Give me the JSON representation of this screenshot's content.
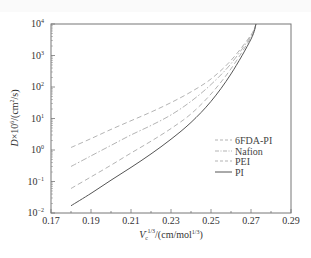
{
  "chart_data": {
    "type": "line",
    "title": "",
    "xlabel": "V_c^-1/3/(cm/mol^1/3)",
    "ylabel": "D×10^6/(cm^2/s)",
    "xlim": [
      0.17,
      0.29
    ],
    "ylim": [
      0.01,
      10000
    ],
    "yscale": "log",
    "grid": false,
    "legend_position": "center-right",
    "x_ticks": [
      "0.17",
      "0.19",
      "0.21",
      "0.23",
      "0.25",
      "0.27",
      "0.29"
    ],
    "y_ticks": [
      "10^-2",
      "10^-1",
      "10^0",
      "10^1",
      "10^2",
      "10^3",
      "10^4"
    ],
    "series": [
      {
        "name": "6FDA-PI",
        "style": "dashed",
        "color": "#aaaaaa",
        "x": [
          0.18,
          0.19,
          0.2,
          0.21,
          0.22,
          0.23,
          0.24,
          0.25,
          0.26,
          0.27,
          0.2725
        ],
        "y": [
          1.2,
          2.3,
          4.5,
          8.5,
          16,
          32,
          70,
          180,
          700,
          4500,
          10000
        ]
      },
      {
        "name": "Nafion",
        "style": "dashdot",
        "color": "#aaaaaa",
        "x": [
          0.18,
          0.19,
          0.2,
          0.21,
          0.22,
          0.23,
          0.24,
          0.25,
          0.26,
          0.27,
          0.2725
        ],
        "y": [
          0.3,
          0.65,
          1.4,
          3.0,
          6.0,
          13,
          35,
          120,
          550,
          4200,
          10000
        ]
      },
      {
        "name": "PEI",
        "style": "dashed",
        "color": "#aaaaaa",
        "x": [
          0.18,
          0.19,
          0.2,
          0.21,
          0.22,
          0.23,
          0.24,
          0.25,
          0.26,
          0.27,
          0.2725
        ],
        "y": [
          0.06,
          0.14,
          0.33,
          0.8,
          1.9,
          4.8,
          14,
          60,
          380,
          3800,
          10000
        ]
      },
      {
        "name": "PI",
        "style": "solid",
        "color": "#555555",
        "x": [
          0.18,
          0.19,
          0.2,
          0.21,
          0.22,
          0.23,
          0.24,
          0.25,
          0.26,
          0.27,
          0.2725
        ],
        "y": [
          0.017,
          0.042,
          0.11,
          0.28,
          0.75,
          2.2,
          7.5,
          35,
          260,
          3300,
          10000
        ]
      }
    ]
  },
  "axes": {
    "x_title_main": "V",
    "x_title_sub": "c",
    "x_title_sup": "−1/3",
    "x_title_rest": "/(cm/mol",
    "x_title_rest_sup": "1/3",
    "x_title_end": ")",
    "y_title_main": "D",
    "y_title_mid": "×10",
    "y_title_sup": "6",
    "y_title_rest": "/(cm",
    "y_title_rest_sup": "2",
    "y_title_end": "/s)"
  },
  "colors": {
    "frame": "#777777",
    "dashed": "#aaaaaa",
    "solid": "#555555",
    "text": "#333333"
  }
}
